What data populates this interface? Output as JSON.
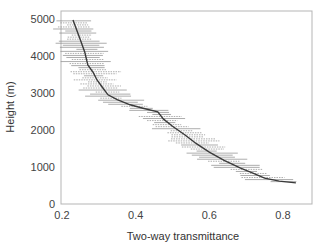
{
  "chart_data": {
    "type": "line",
    "title": "",
    "xlabel": "Two-way transmittance",
    "ylabel": "Height (m)",
    "xlim": [
      0.2,
      0.885
    ],
    "ylim": [
      0,
      5200
    ],
    "grid": false,
    "legend": null,
    "x_ticks": [
      0.2,
      0.4,
      0.6,
      0.8
    ],
    "x_tick_labels": [
      "0.2",
      "0.4",
      "0.6",
      "0.8"
    ],
    "y_ticks": [
      0,
      1000,
      2000,
      3000,
      4000,
      5000
    ],
    "y_tick_labels": [
      "0",
      "1000",
      "2000",
      "3000",
      "4000",
      "5000"
    ],
    "series": [
      {
        "name": "mean transmittance profile",
        "x": [
          0.23,
          0.24,
          0.25,
          0.262,
          0.27,
          0.285,
          0.295,
          0.31,
          0.325,
          0.35,
          0.385,
          0.42,
          0.46,
          0.475,
          0.5,
          0.535,
          0.565,
          0.6,
          0.64,
          0.685,
          0.72,
          0.75,
          0.79,
          0.835
        ],
        "y": [
          4970,
          4700,
          4430,
          4100,
          3760,
          3550,
          3350,
          3150,
          2950,
          2820,
          2680,
          2590,
          2490,
          2300,
          2100,
          1860,
          1630,
          1400,
          1180,
          970,
          830,
          700,
          620,
          570
        ],
        "error_bars": "horizontal, approx ±0.03–0.06 transmittance spread at each level"
      }
    ]
  }
}
